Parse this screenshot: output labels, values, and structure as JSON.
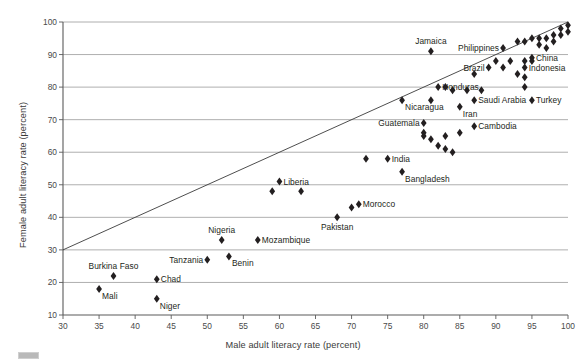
{
  "chart_data": {
    "type": "scatter",
    "title": "",
    "xlabel": "Male adult literacy rate (percent)",
    "ylabel": "Female adult literacy rate (percent)",
    "xlim": [
      30,
      100
    ],
    "ylim": [
      10,
      100
    ],
    "xticks": [
      30,
      35,
      40,
      45,
      50,
      55,
      60,
      65,
      70,
      75,
      80,
      85,
      90,
      95,
      100
    ],
    "yticks": [
      10,
      20,
      30,
      40,
      50,
      60,
      70,
      80,
      90,
      100
    ],
    "grid": "horizontal",
    "legend": "none",
    "reference_line": {
      "name": "equality-line",
      "description": "y = x diagonal reference line",
      "from": [
        30,
        30
      ],
      "to": [
        100,
        100
      ]
    },
    "marker": {
      "shape": "diamond",
      "color": "#231f20",
      "size": 4
    },
    "points": [
      {
        "label": "Mali",
        "x": 35,
        "y": 18,
        "label_pos": "below-right"
      },
      {
        "label": "Burkina Faso",
        "x": 37,
        "y": 22,
        "label_pos": "above"
      },
      {
        "label": "Chad",
        "x": 43,
        "y": 21,
        "label_pos": "right"
      },
      {
        "label": "Niger",
        "x": 43,
        "y": 15,
        "label_pos": "below-right"
      },
      {
        "label": "Tanzania",
        "x": 50,
        "y": 27,
        "label_pos": "left"
      },
      {
        "label": "Benin",
        "x": 53,
        "y": 28,
        "label_pos": "below-right"
      },
      {
        "label": "Nigeria",
        "x": 52,
        "y": 33,
        "label_pos": "above"
      },
      {
        "label": "Mozambique",
        "x": 57,
        "y": 33,
        "label_pos": "right"
      },
      {
        "label": "",
        "x": 59,
        "y": 48,
        "label_pos": ""
      },
      {
        "label": "Liberia",
        "x": 60,
        "y": 51,
        "label_pos": "right"
      },
      {
        "label": "",
        "x": 63,
        "y": 48,
        "label_pos": ""
      },
      {
        "label": "Pakistan",
        "x": 68,
        "y": 40,
        "label_pos": "below"
      },
      {
        "label": "",
        "x": 70,
        "y": 43,
        "label_pos": ""
      },
      {
        "label": "Morocco",
        "x": 71,
        "y": 44,
        "label_pos": "right"
      },
      {
        "label": "",
        "x": 72,
        "y": 58,
        "label_pos": ""
      },
      {
        "label": "India",
        "x": 75,
        "y": 58,
        "label_pos": "right"
      },
      {
        "label": "Bangladesh",
        "x": 77,
        "y": 54,
        "label_pos": "below-right"
      },
      {
        "label": "Guatemala",
        "x": 80,
        "y": 69,
        "label_pos": "left"
      },
      {
        "label": "",
        "x": 80,
        "y": 66,
        "label_pos": ""
      },
      {
        "label": "",
        "x": 80,
        "y": 65,
        "label_pos": ""
      },
      {
        "label": "",
        "x": 81,
        "y": 64,
        "label_pos": ""
      },
      {
        "label": "",
        "x": 82,
        "y": 62,
        "label_pos": ""
      },
      {
        "label": "",
        "x": 83,
        "y": 65,
        "label_pos": ""
      },
      {
        "label": "",
        "x": 83,
        "y": 61,
        "label_pos": ""
      },
      {
        "label": "",
        "x": 84,
        "y": 60,
        "label_pos": ""
      },
      {
        "label": "",
        "x": 85,
        "y": 66,
        "label_pos": ""
      },
      {
        "label": "Cambodia",
        "x": 87,
        "y": 68,
        "label_pos": "right"
      },
      {
        "label": "Nicaragua",
        "x": 77,
        "y": 76,
        "label_pos": "below-right"
      },
      {
        "label": "Honduras",
        "x": 82,
        "y": 80,
        "label_pos": "right"
      },
      {
        "label": "",
        "x": 83,
        "y": 80,
        "label_pos": ""
      },
      {
        "label": "",
        "x": 81,
        "y": 76,
        "label_pos": ""
      },
      {
        "label": "",
        "x": 84,
        "y": 79,
        "label_pos": ""
      },
      {
        "label": "Iran",
        "x": 85,
        "y": 74,
        "label_pos": "below-right"
      },
      {
        "label": "",
        "x": 86,
        "y": 79,
        "label_pos": ""
      },
      {
        "label": "Saudi Arabia",
        "x": 87,
        "y": 76,
        "label_pos": "right"
      },
      {
        "label": "Jamaica",
        "x": 81,
        "y": 91,
        "label_pos": "above"
      },
      {
        "label": "",
        "x": 87,
        "y": 84,
        "label_pos": ""
      },
      {
        "label": "",
        "x": 88,
        "y": 79,
        "label_pos": ""
      },
      {
        "label": "Philippines",
        "x": 91,
        "y": 92,
        "label_pos": "left"
      },
      {
        "label": "",
        "x": 90,
        "y": 88,
        "label_pos": ""
      },
      {
        "label": "Brazil",
        "x": 89,
        "y": 86,
        "label_pos": "left"
      },
      {
        "label": "",
        "x": 91,
        "y": 86,
        "label_pos": ""
      },
      {
        "label": "",
        "x": 92,
        "y": 88,
        "label_pos": ""
      },
      {
        "label": "",
        "x": 93,
        "y": 84,
        "label_pos": ""
      },
      {
        "label": "Indonesia",
        "x": 94,
        "y": 86,
        "label_pos": "right"
      },
      {
        "label": "",
        "x": 94,
        "y": 83,
        "label_pos": ""
      },
      {
        "label": "",
        "x": 94,
        "y": 80,
        "label_pos": ""
      },
      {
        "label": "",
        "x": 94,
        "y": 88,
        "label_pos": ""
      },
      {
        "label": "",
        "x": 95,
        "y": 88,
        "label_pos": ""
      },
      {
        "label": "China",
        "x": 95,
        "y": 89,
        "label_pos": "right"
      },
      {
        "label": "Turkey",
        "x": 95,
        "y": 76,
        "label_pos": "right"
      },
      {
        "label": "",
        "x": 93,
        "y": 94,
        "label_pos": ""
      },
      {
        "label": "",
        "x": 94,
        "y": 94,
        "label_pos": ""
      },
      {
        "label": "",
        "x": 95,
        "y": 95,
        "label_pos": ""
      },
      {
        "label": "",
        "x": 96,
        "y": 95,
        "label_pos": ""
      },
      {
        "label": "",
        "x": 96,
        "y": 93,
        "label_pos": ""
      },
      {
        "label": "",
        "x": 97,
        "y": 95,
        "label_pos": ""
      },
      {
        "label": "",
        "x": 97,
        "y": 92,
        "label_pos": ""
      },
      {
        "label": "",
        "x": 98,
        "y": 96,
        "label_pos": ""
      },
      {
        "label": "",
        "x": 98,
        "y": 94,
        "label_pos": ""
      },
      {
        "label": "",
        "x": 99,
        "y": 98,
        "label_pos": ""
      },
      {
        "label": "",
        "x": 99,
        "y": 96,
        "label_pos": ""
      },
      {
        "label": "",
        "x": 100,
        "y": 99,
        "label_pos": ""
      },
      {
        "label": "",
        "x": 100,
        "y": 97,
        "label_pos": ""
      }
    ],
    "colors": {
      "marker": "#231f20",
      "grid": "#9a9a9a",
      "axis": "#5a5a5a",
      "line": "#3a3a3a",
      "text": "#231f20"
    }
  }
}
